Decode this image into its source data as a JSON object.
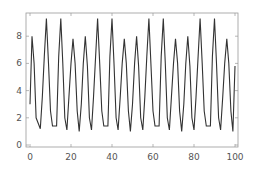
{
  "chart_data": {
    "type": "line",
    "title": "",
    "xlabel": "",
    "ylabel": "",
    "xlim": [
      -2,
      101
    ],
    "ylim": [
      -0.2,
      9.6
    ],
    "grid": false,
    "legend": null,
    "x_ticks": [
      0,
      20,
      40,
      60,
      80,
      100
    ],
    "y_ticks": [
      0,
      2,
      4,
      6,
      8
    ],
    "x_tick_labels": [
      "0",
      "20",
      "40",
      "60",
      "80",
      "100"
    ],
    "y_tick_labels": [
      "0",
      "2",
      "4",
      "6",
      "8"
    ],
    "colors": {
      "line": "#333333",
      "frame": "#999999",
      "background": "#ffffff"
    },
    "series": [
      {
        "name": "sequence",
        "x": [
          0,
          1,
          2,
          3,
          4,
          5,
          6,
          7,
          8,
          9,
          10,
          11,
          12,
          13,
          14,
          15,
          16,
          17,
          18,
          19,
          20,
          21,
          22,
          23,
          24,
          25,
          26,
          27,
          28,
          29,
          30,
          31,
          32,
          33,
          34,
          35,
          36,
          37,
          38,
          39,
          40,
          41,
          42,
          43,
          44,
          45,
          46,
          47,
          48,
          49,
          50,
          51,
          52,
          53,
          54,
          55,
          56,
          57,
          58,
          59,
          60,
          61,
          62,
          63,
          64,
          65,
          66,
          67,
          68,
          69,
          70,
          71,
          72,
          73,
          74,
          75,
          76,
          77,
          78,
          79,
          80,
          81,
          82,
          83,
          84,
          85,
          86,
          87,
          88,
          89,
          90,
          91,
          92,
          93,
          94,
          95,
          96,
          97,
          98,
          99,
          100
        ],
        "values": [
          3.0,
          8.0,
          6.0,
          2.0,
          1.6,
          1.2,
          3.5,
          6.5,
          9.3,
          6.0,
          2.5,
          1.4,
          1.4,
          1.4,
          6.5,
          9.3,
          6.0,
          2.0,
          1.1,
          3.5,
          6.0,
          7.8,
          6.0,
          2.5,
          1.0,
          3.0,
          6.0,
          8.0,
          5.8,
          2.0,
          1.1,
          3.5,
          6.5,
          9.3,
          6.0,
          2.5,
          1.4,
          1.4,
          1.4,
          6.5,
          9.3,
          6.0,
          2.0,
          1.1,
          3.5,
          6.0,
          7.8,
          6.0,
          2.5,
          1.0,
          3.0,
          6.0,
          8.0,
          5.8,
          2.0,
          1.1,
          3.5,
          6.5,
          9.3,
          6.0,
          2.5,
          1.4,
          1.4,
          1.4,
          6.5,
          9.3,
          6.0,
          2.0,
          1.1,
          3.5,
          6.0,
          7.8,
          6.0,
          2.5,
          1.0,
          3.0,
          6.0,
          8.0,
          5.8,
          2.0,
          1.1,
          3.5,
          6.5,
          9.3,
          6.0,
          2.5,
          1.4,
          1.4,
          1.4,
          6.5,
          9.3,
          6.0,
          2.0,
          1.1,
          3.5,
          6.0,
          7.8,
          6.0,
          2.5,
          1.0,
          5.8
        ]
      }
    ]
  }
}
